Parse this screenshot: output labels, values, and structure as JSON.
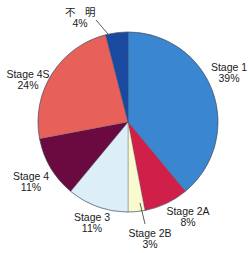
{
  "chart_data": {
    "type": "pie",
    "title": "",
    "start_angle_deg": 0,
    "direction": "clockwise",
    "center": [
      128,
      122
    ],
    "radius": 90,
    "slices": [
      {
        "label": "Stage 1",
        "value": 39,
        "pct_label": "39%",
        "color": "#3a86d0"
      },
      {
        "label": "Stage 2A",
        "value": 8,
        "pct_label": "8%",
        "color": "#d0204a"
      },
      {
        "label": "Stage 2B",
        "value": 3,
        "pct_label": "3%",
        "color": "#fafad0"
      },
      {
        "label": "Stage 3",
        "value": 11,
        "pct_label": "11%",
        "color": "#dceff8"
      },
      {
        "label": "Stage 4",
        "value": 11,
        "pct_label": "11%",
        "color": "#6a0a40"
      },
      {
        "label": "Stage 4S",
        "value": 24,
        "pct_label": "24%",
        "color": "#e8605a"
      },
      {
        "label": "不　明",
        "value": 4,
        "pct_label": "4%",
        "color": "#1a4aa0"
      }
    ],
    "edge_color": "#404858",
    "legend": "none (labels placed around the pie)"
  },
  "labels": {
    "stage1": {
      "name": "Stage 1",
      "pct": "39%",
      "x": 229,
      "y": 62
    },
    "stage2a": {
      "name": "Stage 2A",
      "pct": "8%",
      "x": 188,
      "y": 206
    },
    "stage2b": {
      "name": "Stage 2B",
      "pct": "3%",
      "x": 150,
      "y": 228
    },
    "stage3": {
      "name": "Stage 3",
      "pct": "11%",
      "x": 92,
      "y": 212
    },
    "stage4": {
      "name": "Stage 4",
      "pct": "11%",
      "x": 31,
      "y": 171
    },
    "stage4s": {
      "name": "Stage 4S",
      "pct": "24%",
      "x": 28,
      "y": 69
    },
    "unknown": {
      "name": "不　明",
      "pct": "4%",
      "x": 80,
      "y": 7
    }
  },
  "leaders": [
    {
      "name": "unknown-leader",
      "x1": 96,
      "y1": 20,
      "x2": 108,
      "y2": 34
    },
    {
      "name": "stage2b-leader",
      "x1": 140,
      "y1": 203,
      "x2": 145,
      "y2": 224
    }
  ]
}
